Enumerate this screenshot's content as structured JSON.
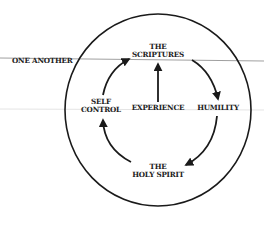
{
  "diagram": {
    "outer_label": "ONE ANOTHER",
    "nodes": {
      "top": {
        "line1": "THE",
        "line2": "SCRIPTURES"
      },
      "right": {
        "line1": "HUMILITY"
      },
      "bottom": {
        "line1": "THE",
        "line2": "HOLY SPIRIT"
      },
      "left": {
        "line1": "SELF",
        "line2": "CONTROL"
      },
      "center": {
        "line1": "EXPERIENCE"
      }
    },
    "colors": {
      "ink": "#1a1a1a",
      "rule": "#9a9a9a"
    }
  }
}
